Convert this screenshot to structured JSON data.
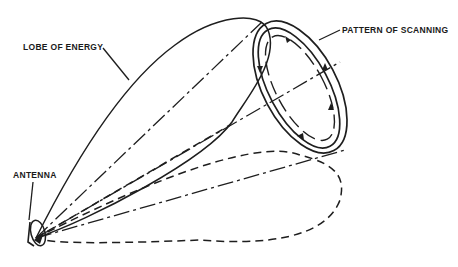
{
  "diagram": {
    "type": "radar conical scanning illustration",
    "labels": {
      "lobe": "LOBE OF ENERGY",
      "pattern": "PATTERN OF SCANNING",
      "antenna": "ANTENNA"
    },
    "colors": {
      "background": "#ffffff",
      "ink": "#1e1e1e"
    }
  }
}
